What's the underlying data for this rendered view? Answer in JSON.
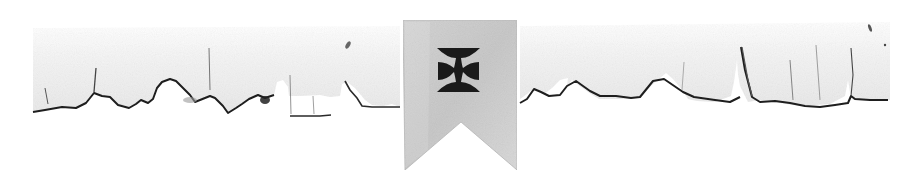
{
  "ornament": {
    "description": "Torn paper divider with pennant banner bearing a cross pattée",
    "colors": {
      "background": "#ffffff",
      "paper": "#f4f4f4",
      "paper_shadow": "#e6e6e6",
      "torn_edge": "#1e1e1e",
      "banner": "#c9c9c9",
      "banner_light": "#dcdcdc",
      "cross": "#1a1a1a"
    },
    "banner": {
      "icon": "cross-pattee-icon",
      "left": 403,
      "right": 517,
      "top": 20,
      "bottom": 170,
      "notch_apex_y": 122
    }
  }
}
